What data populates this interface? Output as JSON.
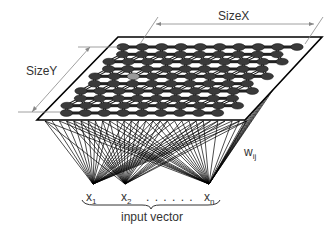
{
  "diagram": {
    "labels": {
      "size_x": "SizeX",
      "size_y": "SizeY",
      "weights": "w",
      "weights_sub": "ij",
      "input_vector": "input vector",
      "dots": ". . . . . .",
      "inputs": [
        {
          "name": "x",
          "sub": "1"
        },
        {
          "name": "x",
          "sub": "2"
        },
        {
          "name": "x",
          "sub": "n"
        }
      ]
    },
    "grid": {
      "rows": 10,
      "cols": 10,
      "neuron_color": "#3a3a3a",
      "highlight_color": "#9a9a9a",
      "highlight_neuron": {
        "row": 4,
        "col": 2
      }
    },
    "colors": {
      "stroke": "#000000",
      "dimension": "#777777",
      "text": "#333333",
      "background": "#ffffff"
    }
  }
}
